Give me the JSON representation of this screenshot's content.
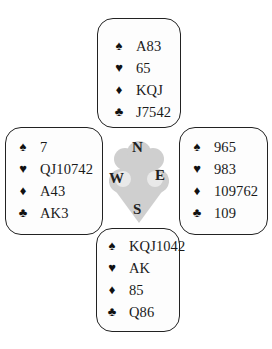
{
  "hands": {
    "north": {
      "label": "North",
      "suits": [
        {
          "suit": "spades",
          "glyph": "♠",
          "cards": "A83"
        },
        {
          "suit": "hearts",
          "glyph": "♥",
          "cards": "65"
        },
        {
          "suit": "diamonds",
          "glyph": "♦",
          "cards": "KQJ"
        },
        {
          "suit": "clubs",
          "glyph": "♣",
          "cards": "J7542"
        }
      ]
    },
    "west": {
      "label": "West",
      "suits": [
        {
          "suit": "spades",
          "glyph": "♠",
          "cards": "7"
        },
        {
          "suit": "hearts",
          "glyph": "♥",
          "cards": "QJ10742"
        },
        {
          "suit": "diamonds",
          "glyph": "♦",
          "cards": "A43"
        },
        {
          "suit": "clubs",
          "glyph": "♣",
          "cards": "AK3"
        }
      ]
    },
    "east": {
      "label": "East",
      "suits": [
        {
          "suit": "spades",
          "glyph": "♠",
          "cards": "965"
        },
        {
          "suit": "hearts",
          "glyph": "♥",
          "cards": "983"
        },
        {
          "suit": "diamonds",
          "glyph": "♦",
          "cards": "109762"
        },
        {
          "suit": "clubs",
          "glyph": "♣",
          "cards": "109"
        }
      ]
    },
    "south": {
      "label": "South",
      "suits": [
        {
          "suit": "spades",
          "glyph": "♠",
          "cards": "KQJ1042"
        },
        {
          "suit": "hearts",
          "glyph": "♥",
          "cards": "AK"
        },
        {
          "suit": "diamonds",
          "glyph": "♦",
          "cards": "85"
        },
        {
          "suit": "clubs",
          "glyph": "♣",
          "cards": "Q86"
        }
      ]
    }
  },
  "compass": {
    "n": "N",
    "e": "E",
    "s": "S",
    "w": "W"
  },
  "colors": {
    "border": "#222222",
    "compass_fill": "#cfcfcf"
  }
}
